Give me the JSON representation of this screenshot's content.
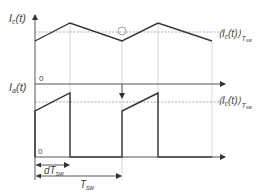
{
  "diagram": {
    "top_plot": {
      "y_label": "I_c(t)",
      "y_label_main": "I",
      "y_label_sub": "c",
      "y_label_suffix": "(t)",
      "avg_label_main": "⟨I",
      "avg_label_sub": "c",
      "avg_label_mid": "(t)⟩",
      "avg_label_subscript": "T",
      "avg_label_subscript2": "sw",
      "zero_label": "0",
      "waveform": "triangle",
      "points": [
        [
          35,
          41
        ],
        [
          70,
          23
        ],
        [
          122,
          41
        ],
        [
          158,
          23
        ],
        [
          212,
          41
        ]
      ]
    },
    "bottom_plot": {
      "y_label_main": "I",
      "y_label_sub": "a",
      "y_label_suffix": "(t)",
      "avg_label_main": "⟨I",
      "avg_label_sub": "c",
      "avg_label_mid": "(t)⟩",
      "avg_label_subscript": "T",
      "avg_label_subscript2": "sw",
      "zero_label": "0",
      "waveform": "pulsed sawtooth"
    },
    "annotations": {
      "duty_interval_main": "dT",
      "duty_interval_sub": "sw",
      "period_main": "T",
      "period_sub": "sw"
    },
    "colors": {
      "waveform": "#333333",
      "axis": "#555555",
      "guide": "#c8c8c8",
      "dashed": "#9a9a9a"
    }
  }
}
